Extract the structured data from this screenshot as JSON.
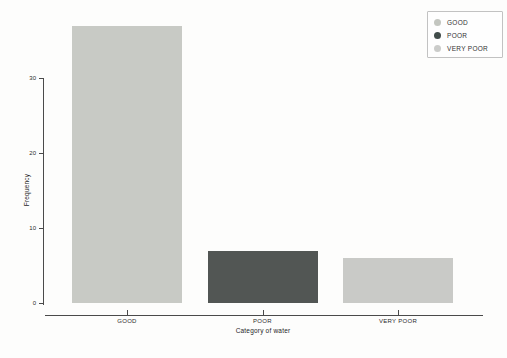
{
  "chart_data": {
    "type": "bar",
    "title": "",
    "categories": [
      "GOOD",
      "POOR",
      "VERY POOR"
    ],
    "values": [
      37,
      7,
      6
    ],
    "bar_colors": [
      "#c8cac5",
      "#525654",
      "#c9cac7"
    ],
    "xlabel": "Category of water",
    "ylabel": "Frequency",
    "yticks": [
      0,
      10,
      20,
      30
    ],
    "ylim": [
      0,
      30
    ],
    "grid": "off",
    "legend": {
      "position": "top-right",
      "items": [
        {
          "label": "GOOD",
          "color": "#c3c6c0"
        },
        {
          "label": "POOR",
          "color": "#414c4a"
        },
        {
          "label": "VERY POOR",
          "color": "#cbccca"
        }
      ]
    }
  }
}
